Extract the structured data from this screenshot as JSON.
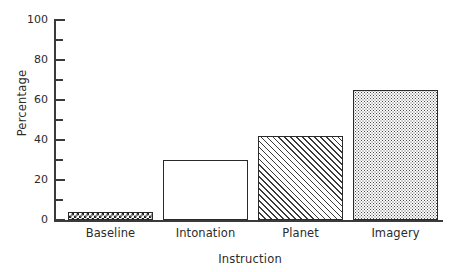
{
  "chart_data": {
    "type": "bar",
    "title": "",
    "xlabel": "Instruction",
    "ylabel": "Percentage",
    "categories": [
      "Baseline",
      "Intonation",
      "Planet",
      "Imagery"
    ],
    "values": [
      4,
      30,
      42,
      65
    ],
    "ylim": [
      0,
      100
    ],
    "ytick_labels": [
      "0",
      "20",
      "40",
      "60",
      "80",
      "100"
    ],
    "ytick_values": [
      0,
      20,
      40,
      60,
      80,
      100
    ],
    "yminor_values": [
      10,
      30,
      50,
      70,
      90
    ],
    "grid": false,
    "legend": "none",
    "bar_fills": [
      "checkerboard",
      "white",
      "diagonal-hatch",
      "dotted"
    ],
    "axis_color": "#3a3a3a",
    "bar_edge_color": "#2a2a2a",
    "background_color": "#ffffff"
  }
}
